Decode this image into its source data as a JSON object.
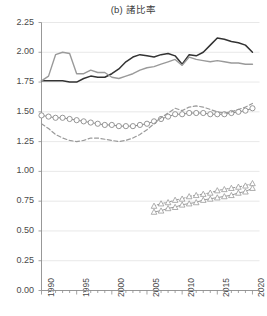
{
  "chart_data": {
    "type": "line",
    "title": "(b) 諸比率",
    "xlabel": "",
    "ylabel": "",
    "xlim": [
      1990,
      2021
    ],
    "ylim": [
      0.0,
      2.25
    ],
    "ytick_labels": [
      "0.00",
      "0.25",
      "0.50",
      "0.75",
      "1.00",
      "1.25",
      "1.50",
      "1.75",
      "2.00",
      "2.25"
    ],
    "ytick_values": [
      0.0,
      0.25,
      0.5,
      0.75,
      1.0,
      1.25,
      1.5,
      1.75,
      2.0,
      2.25
    ],
    "xtick_labels": [
      "1990",
      "1995",
      "2000",
      "2005",
      "2010",
      "2015",
      "2020"
    ],
    "xtick_values": [
      1990,
      1995,
      2000,
      2005,
      2010,
      2015,
      2020
    ],
    "minor_xticks_every": 1,
    "grid": "horizontal",
    "legend": "none",
    "x": [
      1990,
      1991,
      1992,
      1993,
      1994,
      1995,
      1996,
      1997,
      1998,
      1999,
      2000,
      2001,
      2002,
      2003,
      2004,
      2005,
      2006,
      2007,
      2008,
      2009,
      2010,
      2011,
      2012,
      2013,
      2014,
      2015,
      2016,
      2017,
      2018,
      2019,
      2020
    ],
    "series": [
      {
        "name": "series-dark-solid",
        "style": "solid",
        "color": "#333333",
        "marker": "none",
        "width": 1.5,
        "values": [
          1.76,
          1.76,
          1.76,
          1.76,
          1.75,
          1.75,
          1.78,
          1.8,
          1.79,
          1.79,
          1.82,
          1.86,
          1.92,
          1.96,
          1.98,
          1.97,
          1.96,
          1.98,
          1.99,
          1.97,
          1.9,
          1.98,
          1.97,
          2.0,
          2.06,
          2.12,
          2.11,
          2.09,
          2.08,
          2.06,
          2.0
        ]
      },
      {
        "name": "series-gray-solid",
        "style": "solid",
        "color": "#9a9a9a",
        "marker": "none",
        "width": 1.4,
        "values": [
          1.76,
          1.8,
          1.98,
          2.0,
          1.99,
          1.82,
          1.82,
          1.85,
          1.83,
          1.83,
          1.79,
          1.78,
          1.8,
          1.82,
          1.85,
          1.87,
          1.88,
          1.9,
          1.92,
          1.94,
          1.89,
          1.96,
          1.94,
          1.93,
          1.92,
          1.93,
          1.92,
          1.91,
          1.91,
          1.9,
          1.9
        ]
      },
      {
        "name": "series-circles",
        "style": "solid",
        "color": "#8a8a8a",
        "marker": "circle",
        "width": 1.0,
        "values": [
          1.47,
          1.46,
          1.45,
          1.45,
          1.44,
          1.43,
          1.42,
          1.41,
          1.4,
          1.39,
          1.39,
          1.38,
          1.38,
          1.38,
          1.39,
          1.4,
          1.42,
          1.44,
          1.46,
          1.48,
          1.48,
          1.49,
          1.49,
          1.49,
          1.48,
          1.48,
          1.48,
          1.49,
          1.5,
          1.51,
          1.53
        ]
      },
      {
        "name": "series-dashed",
        "style": "dashed",
        "color": "#9a9a9a",
        "marker": "none",
        "width": 1.2,
        "values": [
          1.4,
          1.36,
          1.31,
          1.28,
          1.26,
          1.25,
          1.26,
          1.28,
          1.28,
          1.27,
          1.26,
          1.25,
          1.26,
          1.28,
          1.31,
          1.35,
          1.4,
          1.45,
          1.49,
          1.53,
          1.51,
          1.54,
          1.55,
          1.54,
          1.52,
          1.5,
          1.49,
          1.5,
          1.52,
          1.54,
          1.57
        ]
      },
      {
        "name": "series-triangles-dotted",
        "style": "dotted",
        "color": "#9a9a9a",
        "marker": "triangle",
        "width": 1.0,
        "start_year": 2006,
        "values": [
          null,
          null,
          null,
          null,
          null,
          null,
          null,
          null,
          null,
          null,
          null,
          null,
          null,
          null,
          null,
          null,
          0.71,
          0.73,
          0.74,
          0.76,
          0.77,
          0.79,
          0.8,
          0.81,
          0.82,
          0.84,
          0.85,
          0.86,
          0.87,
          0.88,
          0.9
        ]
      },
      {
        "name": "series-triangles-solid",
        "style": "solid",
        "color": "#9a9a9a",
        "marker": "triangle",
        "width": 1.0,
        "start_year": 2006,
        "values": [
          null,
          null,
          null,
          null,
          null,
          null,
          null,
          null,
          null,
          null,
          null,
          null,
          null,
          null,
          null,
          null,
          0.66,
          0.67,
          0.69,
          0.7,
          0.72,
          0.73,
          0.74,
          0.76,
          0.77,
          0.78,
          0.79,
          0.8,
          0.82,
          0.83,
          0.86
        ]
      }
    ]
  }
}
